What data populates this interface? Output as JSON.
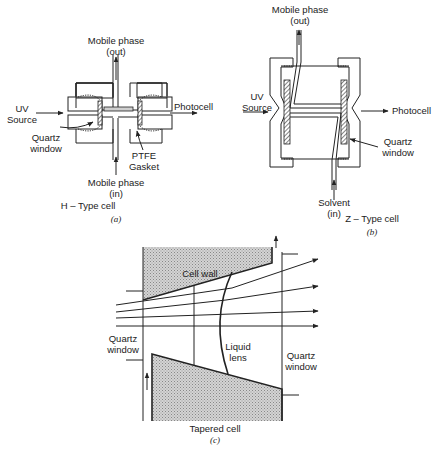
{
  "figure": {
    "panels": [
      {
        "id": "a",
        "caption": "(a)",
        "title": "H – Type cell",
        "labels": {
          "outlet": [
            "Mobile phase",
            "(out)"
          ],
          "inlet": [
            "Mobile phase",
            "(in)"
          ],
          "source": [
            "UV",
            "Source"
          ],
          "detector": "Photocell",
          "window": [
            "Quartz",
            "window"
          ],
          "gasket": [
            "PTFE",
            "Gasket"
          ]
        }
      },
      {
        "id": "b",
        "caption": "(b)",
        "title": "Z – Type cell",
        "labels": {
          "outlet": [
            "Mobile phase",
            "(out)"
          ],
          "inlet": [
            "Solvent",
            "(in)"
          ],
          "source": [
            "UV",
            "Source"
          ],
          "detector": "Photocell",
          "window": [
            "Quartz",
            "window"
          ]
        }
      },
      {
        "id": "c",
        "caption": "(c)",
        "title": "Tapered cell",
        "labels": {
          "wall": "Cell wall",
          "lens": [
            "Liquid",
            "lens"
          ],
          "window_left": [
            "Quartz",
            "window"
          ],
          "window_right": [
            "Quartz",
            "window"
          ]
        }
      }
    ]
  }
}
